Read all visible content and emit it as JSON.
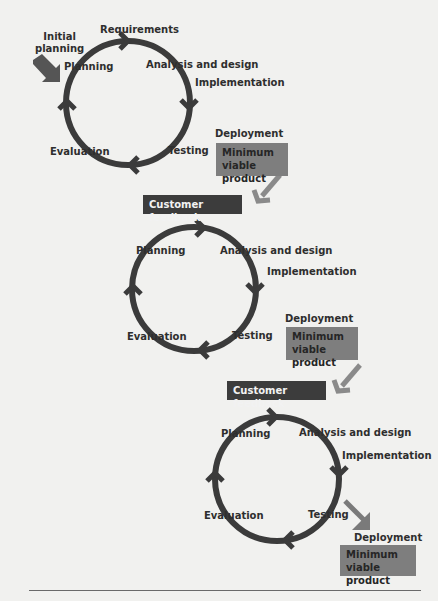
{
  "colors": {
    "ring": "#3b3b3b",
    "arrow": "#7a7a7a",
    "box": "#7e7e7e",
    "feedback": "#3c3c3c",
    "background": "#f1f1ef"
  },
  "cycle1": {
    "entry_label": [
      "Initial",
      "planning"
    ],
    "top_label": "Requirements",
    "stages": [
      "Planning",
      "Analysis and design",
      "Implementation",
      "Testing",
      "Evaluation"
    ],
    "deployment": "Deployment",
    "mvp": [
      "Minimum",
      "viable product"
    ]
  },
  "feedback1": "Customer feedback",
  "cycle2": {
    "stages": [
      "Planning",
      "Analysis and design",
      "Implementation",
      "Testing",
      "Evaluation"
    ],
    "deployment": "Deployment",
    "mvp": [
      "Minimum",
      "viable product"
    ]
  },
  "feedback2": "Customer feedback",
  "cycle3": {
    "stages": [
      "Planning",
      "Analysis and design",
      "Implementation",
      "Testing",
      "Evaluation"
    ],
    "deployment": "Deployment",
    "mvp": [
      "Minimum",
      "viable product"
    ]
  }
}
